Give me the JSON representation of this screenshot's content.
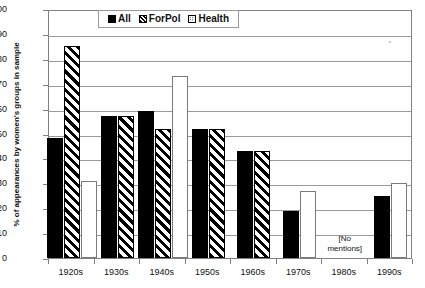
{
  "chart_data": {
    "type": "bar",
    "title": "",
    "xlabel": "",
    "ylabel": "% of appearances by women's groups in sample",
    "ylim": [
      0,
      100
    ],
    "ytick_step": 10,
    "yticks": [
      100,
      90,
      80,
      70,
      60,
      50,
      40,
      30,
      20,
      10,
      0
    ],
    "grid": true,
    "legend_position": "top-center",
    "categories": [
      "1920s",
      "1930s",
      "1940s",
      "1950s",
      "1960s",
      "1970s",
      "1980s",
      "1990s"
    ],
    "series": [
      {
        "name": "All",
        "pattern": "solid-black",
        "values": [
          48,
          57,
          59,
          52,
          43,
          19,
          null,
          25
        ]
      },
      {
        "name": "ForPol",
        "pattern": "diagonal-hatch",
        "values": [
          85,
          57,
          52,
          52,
          43,
          null,
          null,
          null
        ]
      },
      {
        "name": "Health",
        "pattern": "dotted",
        "values": [
          31,
          null,
          73,
          null,
          null,
          27,
          null,
          30
        ]
      }
    ],
    "annotations": [
      {
        "text": "[No\nmentions]",
        "category": "1980s",
        "value": 5
      }
    ]
  },
  "legend": {
    "items": [
      {
        "label": "All",
        "swatch": "solid-black-swatch"
      },
      {
        "label": "ForPol",
        "swatch": "diagonal-hatch-swatch"
      },
      {
        "label": "Health",
        "swatch": "dotted-swatch"
      }
    ]
  },
  "colors": {
    "bar_all": "#000000",
    "bar_forpol_stripe": "#000000",
    "bar_health_dot": "#2b2b2b",
    "grid": "#9a9a9a",
    "axis": "#808080",
    "text": "#111111",
    "background": "#ffffff"
  }
}
